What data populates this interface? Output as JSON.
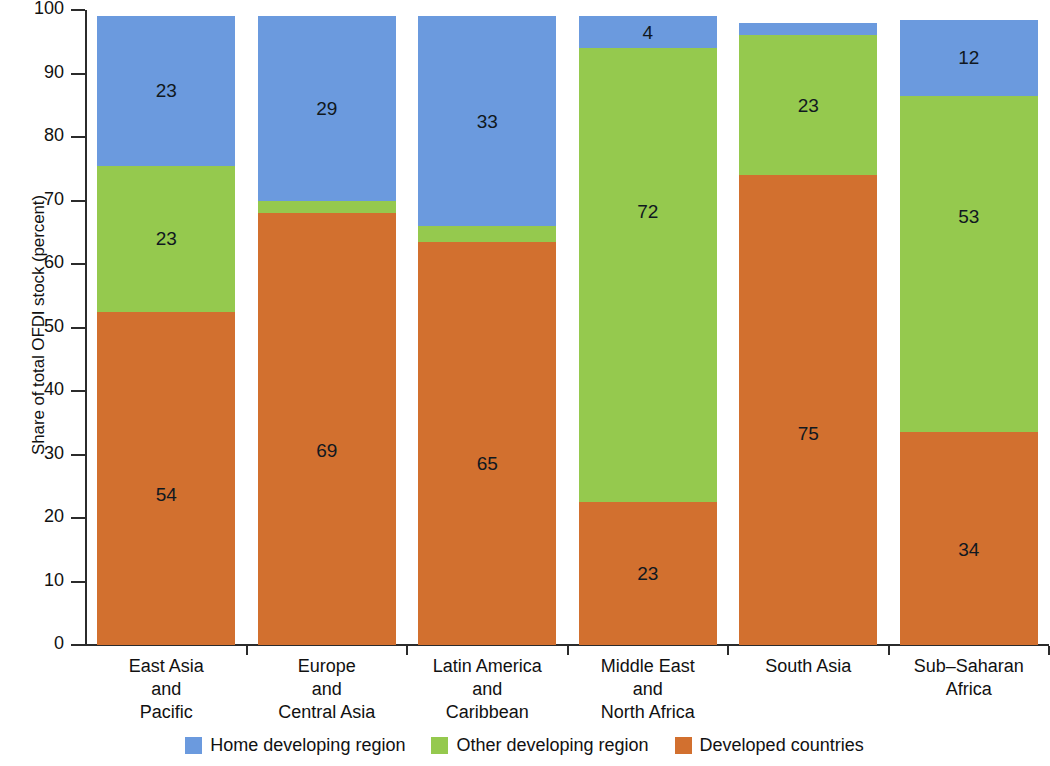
{
  "chart_data": {
    "type": "bar",
    "subtype": "stacked-bar-100",
    "title": "",
    "xlabel": "",
    "ylabel": "Share of total OFDI stock (percent)",
    "ylim": [
      0,
      100
    ],
    "yticks": [
      0,
      10,
      20,
      30,
      40,
      50,
      60,
      70,
      80,
      90,
      100
    ],
    "ytick_labels": [
      "0",
      "10",
      "20",
      "30",
      "40",
      "50",
      "60",
      "70",
      "80",
      "90",
      "100"
    ],
    "grid": false,
    "legend_position": "bottom-center",
    "categories": [
      "East Asia and Pacific",
      "Europe and Central Asia",
      "Latin America and Caribbean",
      "Middle East and North Africa",
      "South Asia",
      "Sub-Saharan Africa"
    ],
    "category_lines": [
      [
        "East Asia",
        "and",
        "Pacific"
      ],
      [
        "Europe",
        "and",
        "Central Asia"
      ],
      [
        "Latin America",
        "and",
        "Caribbean"
      ],
      [
        "Middle East",
        "and",
        "North Africa"
      ],
      [
        "South Asia"
      ],
      [
        "Sub–Saharan",
        "Africa"
      ]
    ],
    "series": [
      {
        "name": "Developed countries",
        "color": "#d2702f",
        "values": [
          54,
          69,
          65,
          23,
          75,
          34
        ],
        "segment_extent": [
          52.5,
          68.0,
          63.5,
          22.5,
          74.0,
          33.5
        ],
        "labels": [
          "54",
          "69",
          "65",
          "23",
          "75",
          "34"
        ]
      },
      {
        "name": "Other developing region",
        "color": "#95c94e",
        "values": [
          23,
          2,
          2,
          72,
          23,
          53
        ],
        "segment_extent": [
          75.5,
          70.0,
          66.0,
          94.0,
          96.0,
          86.5
        ],
        "labels": [
          "23",
          "",
          "",
          "72",
          "23",
          "53"
        ]
      },
      {
        "name": "Home developing region",
        "color": "#6b9ade",
        "values": [
          23,
          29,
          33,
          4,
          1,
          12
        ],
        "segment_extent": [
          99.0,
          99.0,
          99.0,
          99.0,
          98.0,
          98.5
        ],
        "labels": [
          "23",
          "29",
          "33",
          "4",
          "",
          "12"
        ]
      }
    ],
    "legend": [
      {
        "label": "Home developing region",
        "color": "#6b9ade"
      },
      {
        "label": "Other developing region",
        "color": "#95c94e"
      },
      {
        "label": "Developed countries",
        "color": "#d2702f"
      }
    ]
  }
}
